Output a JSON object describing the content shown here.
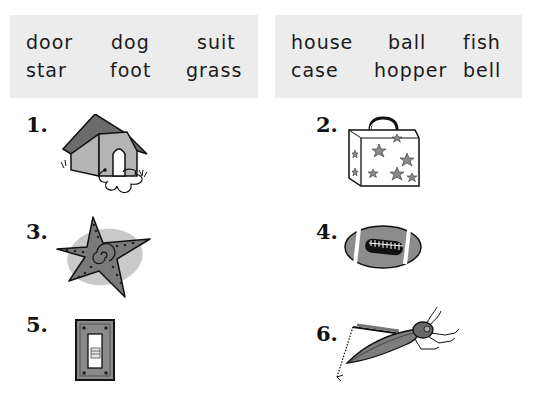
{
  "word_bank": {
    "left": {
      "row1": [
        "door",
        "dog",
        "suit"
      ],
      "row2": [
        "star",
        "foot",
        "grass"
      ]
    },
    "right": {
      "row1": [
        "house",
        "ball",
        "fish"
      ],
      "row2": [
        "case",
        "hopper",
        "bell"
      ]
    }
  },
  "items": [
    {
      "number": "1.",
      "picture": "doghouse-icon"
    },
    {
      "number": "2.",
      "picture": "suitcase-icon"
    },
    {
      "number": "3.",
      "picture": "starfish-icon"
    },
    {
      "number": "4.",
      "picture": "football-icon"
    },
    {
      "number": "5.",
      "picture": "light-switch-icon"
    },
    {
      "number": "6.",
      "picture": "grasshopper-icon"
    }
  ]
}
